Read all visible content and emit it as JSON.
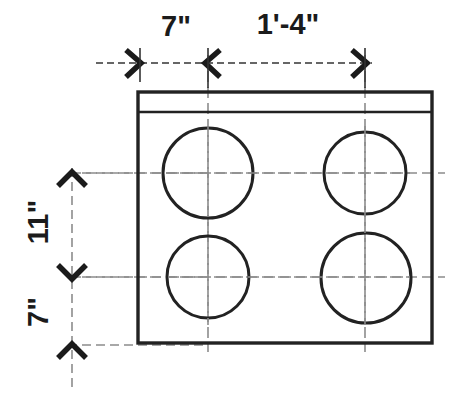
{
  "drawing": {
    "type": "architectural-dimension-drawing",
    "title": "Plan view of rectangular block with four circular openings",
    "background_color": "#ffffff",
    "line_color": "#222222",
    "centerline_color": "#8c8c8c",
    "dimension_line_color": "#555555",
    "units": "imperial-feet-inches",
    "horizontal_dimensions": [
      {
        "id": "dim-h-7in",
        "label": "7\"",
        "label_x": 176,
        "label_y": 35,
        "start_x": 138,
        "end_x": 208,
        "line_y": 63
      },
      {
        "id": "dim-h-1ft4in",
        "label": "1'-4\"",
        "label_x": 288,
        "label_y": 34,
        "start_x": 208,
        "end_x": 365,
        "line_y": 63
      }
    ],
    "vertical_dimensions": [
      {
        "id": "dim-v-11in",
        "label": "11\"",
        "label_x": 48,
        "label_y": 220,
        "start_y": 173,
        "end_y": 277,
        "line_x": 72,
        "rotation": -90
      },
      {
        "id": "dim-v-7in",
        "label": "7\"",
        "label_x": 48,
        "label_y": 312,
        "start_y": 277,
        "end_y": 345,
        "line_x": 72,
        "rotation": -90
      }
    ],
    "body_rect": {
      "x": 138,
      "y": 92,
      "width": 294,
      "height": 251
    },
    "ledge_line_y": 112,
    "circles": [
      {
        "id": "hole-top-left",
        "cx": 208,
        "cy": 173,
        "r": 45
      },
      {
        "id": "hole-top-right",
        "cx": 365,
        "cy": 173,
        "r": 41
      },
      {
        "id": "hole-bottom-left",
        "cx": 208,
        "cy": 277,
        "r": 41
      },
      {
        "id": "hole-bottom-right",
        "cx": 366,
        "cy": 278,
        "r": 45
      }
    ],
    "centerlines": {
      "horizontal": [
        {
          "id": "centerline-row-upper",
          "y": 173,
          "x1": 70,
          "x2": 445
        },
        {
          "id": "centerline-row-lower",
          "y": 277,
          "x1": 70,
          "x2": 445
        }
      ],
      "vertical": [
        {
          "id": "centerline-col-left",
          "x": 208,
          "y1": 55,
          "y2": 350
        },
        {
          "id": "centerline-col-right",
          "x": 365,
          "y1": 55,
          "y2": 350
        }
      ],
      "dimension_extensions": [
        {
          "id": "ext-line-bottom-datum",
          "y": 345,
          "x1": 70,
          "x2": 200
        },
        {
          "id": "ext-line-vert-datum",
          "x": 72,
          "y1": 165,
          "y2": 392
        }
      ]
    }
  }
}
